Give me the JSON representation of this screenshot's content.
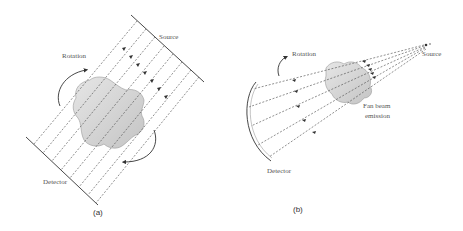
{
  "diagram": {
    "panel_a": {
      "label": "(a)",
      "source_label": "Source",
      "detector_label": "Detector",
      "rotation_label": "Rotation",
      "beam_type": "parallel",
      "ray_count": 9
    },
    "panel_b": {
      "label": "(b)",
      "source_label": "Source",
      "detector_label": "Detector",
      "rotation_label": "Rotation",
      "beam_label_line1": "Fan beam",
      "beam_label_line2": "emission",
      "beam_type": "fan",
      "ray_count": 5
    },
    "colors": {
      "line": "#333333",
      "object_fill": "#d4d4d4",
      "text": "#555555"
    }
  }
}
